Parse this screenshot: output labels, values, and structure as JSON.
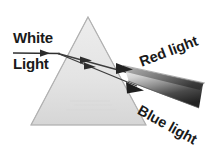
{
  "figure": {
    "labels": {
      "white": "White",
      "light": "Light",
      "red": "Red light",
      "blue": "Blue light"
    },
    "colors": {
      "background": "#ffffff",
      "text": "#1a1a1a",
      "prism_fill_top": "#e8e8e8",
      "prism_fill_bottom": "#d9d9d9",
      "prism_stroke": "#9a9a9a",
      "ray_stroke": "#3a3a3a",
      "beam_dark": "#2b2b2b",
      "beam_light": "#f2f2f2"
    },
    "elements": {
      "incoming_ray": "horizontal white-light ray entering left face of prism",
      "internal_rays": "two refracted rays travelling through the prism body",
      "exit_beam": "fanned wedge beam leaving the right face, graded dark to light",
      "arrowheads": 4,
      "prism": "equilateral triangle, apex up"
    },
    "geometry": {
      "prism_apex": [
        88,
        17
      ],
      "prism_base_left": [
        31,
        125
      ],
      "prism_base_right": [
        146,
        125
      ],
      "incoming_ray_start": [
        13,
        53
      ],
      "incoming_ray_end": [
        58,
        53
      ]
    }
  }
}
